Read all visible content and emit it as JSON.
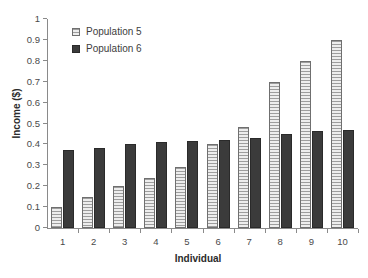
{
  "chart_data": {
    "type": "bar",
    "title": "",
    "xlabel": "Individual",
    "ylabel": "Income ($)",
    "categories": [
      "1",
      "2",
      "3",
      "4",
      "5",
      "6",
      "7",
      "8",
      "9",
      "10"
    ],
    "series": [
      {
        "name": "Population 5",
        "color": "#b4b4b4",
        "values": [
          0.1,
          0.15,
          0.2,
          0.24,
          0.29,
          0.4,
          0.485,
          0.7,
          0.8,
          0.9
        ]
      },
      {
        "name": "Population 6",
        "color": "#3b3b3b",
        "values": [
          0.375,
          0.385,
          0.4,
          0.41,
          0.415,
          0.42,
          0.43,
          0.45,
          0.465,
          0.47
        ]
      }
    ],
    "ylim": [
      0,
      1
    ],
    "ytick_labels": [
      "0",
      "0.1",
      "0.2",
      "0.3",
      "0.4",
      "0.5",
      "0.6",
      "0.7",
      "0.8",
      "0.9",
      "1"
    ],
    "ytick_values": [
      0,
      0.1,
      0.2,
      0.3,
      0.4,
      0.5,
      0.6,
      0.7,
      0.8,
      0.9,
      1
    ],
    "grid": false,
    "legend_position": "top-left-inside"
  }
}
